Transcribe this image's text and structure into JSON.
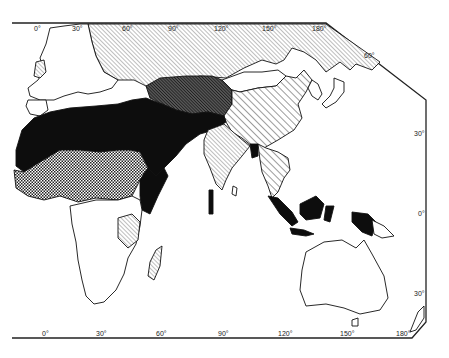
{
  "map": {
    "projection": "Eastern hemisphere (Old World) thematic map",
    "colors": {
      "background": "#ffffff",
      "ink": "#111111",
      "solid": "#0d0d0d"
    },
    "fill_categories": [
      {
        "id": "solid",
        "pattern": "solid-black"
      },
      {
        "id": "crosshatch",
        "pattern": "cross-hatch"
      },
      {
        "id": "dense-diagonal",
        "pattern": "dense-diagonal-hatch"
      },
      {
        "id": "wide-diagonal",
        "pattern": "wide-diagonal-hatch"
      },
      {
        "id": "fine-diagonal",
        "pattern": "fine-diagonal-hatch"
      },
      {
        "id": "none",
        "pattern": "white"
      }
    ],
    "top_longitude_labels": [
      "0°",
      "30°",
      "60°",
      "90°",
      "120°",
      "150°",
      "180°"
    ],
    "bottom_longitude_labels": [
      "0°",
      "30°",
      "60°",
      "90°",
      "120°",
      "150°",
      "180°"
    ],
    "right_latitude_labels": [
      "60°",
      "30°",
      "0°",
      "30°"
    ]
  }
}
